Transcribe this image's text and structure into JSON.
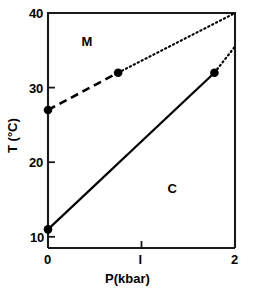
{
  "chart_data": {
    "type": "line",
    "title": "",
    "xlabel": "P(kbar)",
    "ylabel": "T (°C)",
    "xlim": [
      0,
      2
    ],
    "ylim": [
      8.5,
      40
    ],
    "grid": false,
    "legend": null,
    "xticks": [
      {
        "value": 0,
        "label": "0"
      },
      {
        "value": 1,
        "label": "l"
      },
      {
        "value": 2,
        "label": "2"
      }
    ],
    "yticks": [
      {
        "value": 10,
        "label": "10"
      },
      {
        "value": 20,
        "label": "20"
      },
      {
        "value": 30,
        "label": "30"
      },
      {
        "value": 40,
        "label": "40"
      }
    ],
    "series": [
      {
        "name": "upper-boundary",
        "style": "dashed",
        "points": [
          {
            "x": 0,
            "y": 27
          },
          {
            "x": 0.75,
            "y": 32
          }
        ],
        "markers": [
          {
            "x": 0,
            "y": 27
          },
          {
            "x": 0.75,
            "y": 32
          }
        ]
      },
      {
        "name": "upper-boundary-extrapolated",
        "style": "dotted",
        "points": [
          {
            "x": 0.75,
            "y": 32
          },
          {
            "x": 2,
            "y": 40
          }
        ],
        "markers": []
      },
      {
        "name": "lower-boundary",
        "style": "solid",
        "points": [
          {
            "x": 0,
            "y": 11
          },
          {
            "x": 1.78,
            "y": 32
          }
        ],
        "markers": [
          {
            "x": 0,
            "y": 11
          },
          {
            "x": 1.78,
            "y": 32
          }
        ]
      },
      {
        "name": "lower-boundary-extrapolated",
        "style": "dotted",
        "points": [
          {
            "x": 1.78,
            "y": 32
          },
          {
            "x": 2,
            "y": 35.5
          }
        ],
        "markers": []
      }
    ],
    "annotations": [
      {
        "text": "M",
        "x": 0.4,
        "y": 36.3,
        "name": "region-label-m"
      },
      {
        "text": "C",
        "x": 1.32,
        "y": 16.6,
        "name": "region-label-c"
      }
    ]
  },
  "axes": {
    "y_title": "T (°C)",
    "x_title": "P(kbar)",
    "y_tick_labels": [
      "40",
      "30",
      "20",
      "10"
    ],
    "x_tick_labels": [
      "0",
      "l",
      "2"
    ]
  },
  "regions": {
    "upper": "M",
    "lower": "C"
  },
  "colors": {
    "line": "#000000",
    "marker": "#000000",
    "axis": "#1a1a1a",
    "background": "#ffffff"
  }
}
